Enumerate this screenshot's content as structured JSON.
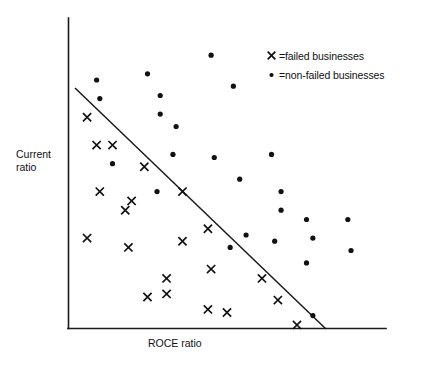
{
  "chart_data": {
    "type": "scatter",
    "title": "",
    "subtitle": "",
    "xlabel": "ROCE ratio",
    "ylabel": "Current\nratio",
    "grid": false,
    "axis_ticks": false,
    "xlim": [
      0,
      100
    ],
    "ylim": [
      0,
      100
    ],
    "legend_position": "top-right",
    "annotations": [
      {
        "name": "discriminant-line",
        "type": "line",
        "description": "straight discriminant boundary separating failed from non-failed businesses",
        "from": [
          2,
          77
        ],
        "to": [
          81,
          0
        ]
      }
    ],
    "series": [
      {
        "name": "failed businesses",
        "marker": "x",
        "color": "#111111",
        "points": [
          [
            6,
            68
          ],
          [
            9,
            59
          ],
          [
            14,
            59
          ],
          [
            24,
            52
          ],
          [
            10,
            44
          ],
          [
            20,
            41
          ],
          [
            18,
            38
          ],
          [
            19,
            26
          ],
          [
            6,
            29
          ],
          [
            36,
            44
          ],
          [
            44,
            32
          ],
          [
            36,
            28
          ],
          [
            45,
            19
          ],
          [
            61,
            16
          ],
          [
            31,
            16
          ],
          [
            25,
            10
          ],
          [
            31,
            11
          ],
          [
            44,
            6
          ],
          [
            66,
            9
          ],
          [
            50,
            5
          ],
          [
            72,
            1
          ]
        ]
      },
      {
        "name": "non-failed businesses",
        "marker": "dot",
        "color": "#111111",
        "points": [
          [
            45,
            88
          ],
          [
            25,
            82
          ],
          [
            9,
            80
          ],
          [
            29,
            75
          ],
          [
            10,
            74
          ],
          [
            52,
            78
          ],
          [
            29,
            69
          ],
          [
            34,
            65
          ],
          [
            33,
            56
          ],
          [
            46,
            55
          ],
          [
            14,
            53
          ],
          [
            64,
            56
          ],
          [
            28,
            44
          ],
          [
            54,
            48
          ],
          [
            67,
            44
          ],
          [
            67,
            38
          ],
          [
            56,
            30
          ],
          [
            51,
            26
          ],
          [
            65,
            28
          ],
          [
            75,
            35
          ],
          [
            77,
            29
          ],
          [
            75,
            21
          ],
          [
            77,
            4
          ],
          [
            88,
            35
          ],
          [
            89,
            25
          ]
        ]
      }
    ],
    "legend": [
      {
        "marker": "x",
        "text": "=failed businesses"
      },
      {
        "marker": "dot",
        "text": "=non-failed businesses"
      }
    ]
  },
  "axes": {
    "y_label": "Current\nratio",
    "x_label": "ROCE ratio"
  },
  "legend": {
    "failed": {
      "symbol": "x",
      "label": "=failed businesses"
    },
    "non_failed": {
      "symbol": "•",
      "label": "=non-failed businesses"
    }
  },
  "colors": {
    "ink": "#111111",
    "background": "#ffffff"
  }
}
